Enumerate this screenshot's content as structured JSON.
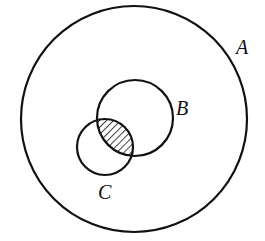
{
  "diagram": {
    "type": "venn",
    "stroke_color": "#111111",
    "background": "#ffffff",
    "sets": [
      {
        "id": "A",
        "label": "A",
        "cx": 134,
        "cy": 119,
        "r": 113,
        "label_x": 236,
        "label_y": 54
      },
      {
        "id": "B",
        "label": "B",
        "cx": 135,
        "cy": 118,
        "r": 38,
        "label_x": 176,
        "label_y": 115
      },
      {
        "id": "C",
        "label": "C",
        "cx": 105,
        "cy": 147,
        "r": 28,
        "label_x": 98,
        "label_y": 199
      }
    ],
    "shaded_region": "B ∩ C",
    "shading_style": "diagonal-hatch"
  }
}
